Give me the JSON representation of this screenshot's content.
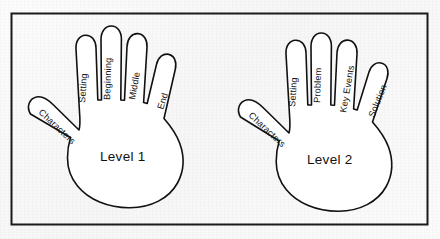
{
  "worksheet": {
    "title_hidden": "",
    "background_color": "#fafafa",
    "ink_color": "#111111",
    "frame": {
      "name": "worksheet-border",
      "stroke_color": "#1b1b1b",
      "stroke_width": 2
    }
  },
  "hands": [
    {
      "id": "left-hand",
      "center_label": "Level 1",
      "thumb": {
        "label": "Characters"
      },
      "fingers": [
        {
          "position": "index",
          "label": "Setting"
        },
        {
          "position": "middle",
          "label": "Beginning"
        },
        {
          "position": "ring",
          "label": "Middle"
        },
        {
          "position": "pinky",
          "label": "End"
        }
      ]
    },
    {
      "id": "right-hand",
      "center_label": "Level 2",
      "thumb": {
        "label": "Characters"
      },
      "fingers": [
        {
          "position": "index",
          "label": "Setting"
        },
        {
          "position": "middle",
          "label": "Problem"
        },
        {
          "position": "ring",
          "label": "Key Events"
        },
        {
          "position": "pinky",
          "label": "Solution"
        }
      ]
    }
  ]
}
